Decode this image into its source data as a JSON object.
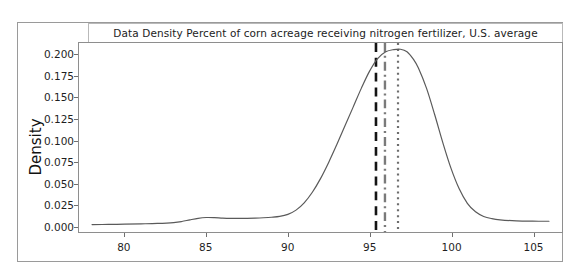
{
  "figure": {
    "title": "Data Density Percent of corn acreage receiving nitrogen fertilizer, U.S. average",
    "background_color": "#ffffff",
    "frame_color": "#9a9a9a"
  },
  "chart_data": {
    "type": "line",
    "title": "Data Density Percent of corn acreage receiving nitrogen fertilizer, U.S. average",
    "xlabel": "",
    "ylabel": "Density",
    "xlim": [
      77.2,
      106.8
    ],
    "ylim": [
      -0.0075,
      0.2145
    ],
    "grid": false,
    "legend": null,
    "xticks": [
      80,
      85,
      90,
      95,
      100,
      105
    ],
    "xtick_labels": [
      "80",
      "85",
      "90",
      "95",
      "100",
      "105"
    ],
    "yticks": [
      0.0,
      0.025,
      0.05,
      0.075,
      0.1,
      0.125,
      0.15,
      0.175,
      0.2
    ],
    "ytick_labels": [
      "0.000",
      "0.025",
      "0.050",
      "0.075",
      "0.100",
      "0.125",
      "0.150",
      "0.175",
      "0.200"
    ],
    "series": [
      {
        "name": "density",
        "type": "kde-curve",
        "color": "#5a5a5a",
        "linewidth": 1.2,
        "x": [
          78.0,
          79.0,
          80.0,
          81.0,
          82.0,
          83.0,
          83.5,
          84.0,
          84.5,
          85.0,
          85.5,
          86.0,
          86.5,
          87.0,
          87.5,
          88.0,
          88.5,
          89.0,
          89.5,
          90.0,
          90.5,
          91.0,
          91.5,
          92.0,
          92.5,
          93.0,
          93.5,
          94.0,
          94.5,
          95.0,
          95.5,
          96.0,
          96.5,
          96.9,
          97.3,
          97.7,
          98.0,
          98.5,
          99.0,
          99.5,
          100.0,
          100.5,
          101.0,
          101.5,
          102.0,
          102.5,
          103.0,
          104.0,
          105.0,
          106.0
        ],
        "y": [
          0.0012,
          0.0014,
          0.0017,
          0.0021,
          0.0026,
          0.0036,
          0.0048,
          0.0068,
          0.0086,
          0.0095,
          0.0094,
          0.0089,
          0.0086,
          0.0085,
          0.0086,
          0.0088,
          0.0092,
          0.0098,
          0.0108,
          0.0132,
          0.0182,
          0.0268,
          0.0392,
          0.0552,
          0.0742,
          0.0952,
          0.1172,
          0.1392,
          0.1612,
          0.1812,
          0.1962,
          0.2042,
          0.2068,
          0.2072,
          0.2042,
          0.1952,
          0.1852,
          0.1612,
          0.1302,
          0.0972,
          0.0672,
          0.0432,
          0.0262,
          0.0162,
          0.0108,
          0.0082,
          0.0068,
          0.0056,
          0.0052,
          0.0051
        ]
      }
    ],
    "vertical_lines": [
      {
        "name": "line-dashed-black",
        "x": 95.4,
        "style": "dashed",
        "color": "#141414",
        "linewidth": 2.6
      },
      {
        "name": "line-dashdot-gray",
        "x": 95.95,
        "style": "dashdot",
        "color": "#7a7a7a",
        "linewidth": 2.4
      },
      {
        "name": "line-dotted-gray",
        "x": 96.75,
        "style": "dotted",
        "color": "#6d6d6d",
        "linewidth": 2.2
      }
    ],
    "annotations": []
  },
  "axes": {
    "y_label": "Density",
    "y_tick_labels": [
      "0.200",
      "0.175",
      "0.150",
      "0.125",
      "0.100",
      "0.075",
      "0.050",
      "0.025",
      "0.000"
    ],
    "x_tick_labels": [
      "80",
      "85",
      "90",
      "95",
      "100",
      "105"
    ]
  }
}
